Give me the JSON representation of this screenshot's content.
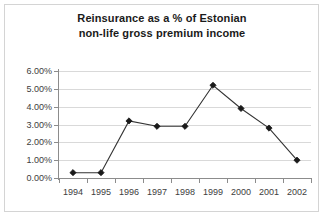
{
  "chart_data": {
    "type": "line",
    "title": "Reinsurance as a % of Estonian non-life gross premium income",
    "title_lines": [
      "Reinsurance as a % of Estonian",
      "non-life gross premium income"
    ],
    "xlabel": "",
    "ylabel": "",
    "categories": [
      "1994",
      "1995",
      "1996",
      "1997",
      "1998",
      "1999",
      "2000",
      "2001",
      "2002"
    ],
    "values": [
      0.3,
      0.3,
      3.2,
      2.9,
      2.9,
      5.2,
      3.9,
      2.8,
      1.0
    ],
    "series": [
      {
        "name": "Reinsurance share",
        "values": [
          0.3,
          0.3,
          3.2,
          2.9,
          2.9,
          5.2,
          3.9,
          2.8,
          1.0
        ]
      }
    ],
    "ylim": [
      0,
      6
    ],
    "ytick_values": [
      0,
      1,
      2,
      3,
      4,
      5,
      6
    ],
    "ytick_labels": [
      "0.00%",
      "1.00%",
      "2.00%",
      "3.00%",
      "4.00%",
      "5.00%",
      "6.00%"
    ],
    "grid": true,
    "legend": false,
    "legend_position": "none",
    "marker": "diamond",
    "line_color": "#333333",
    "marker_color": "#1a1a1a",
    "grid_color": "#d9d9d9",
    "axis_color": "#8c8c8c",
    "background_color": "#ffffff",
    "border_color": "#d4d4d4"
  }
}
